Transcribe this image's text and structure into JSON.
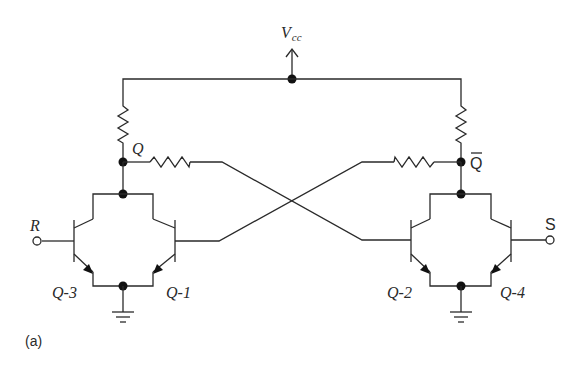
{
  "diagram": {
    "type": "circuit-schematic",
    "figure_label": "(a)",
    "supply": {
      "label_main": "V",
      "label_sub": "cc"
    },
    "outputs": {
      "q": "Q",
      "q_bar": "Q"
    },
    "inputs": {
      "reset": "R",
      "set": "S"
    },
    "transistors": [
      {
        "id": "q3",
        "label": "Q-3"
      },
      {
        "id": "q1",
        "label": "Q-1"
      },
      {
        "id": "q2",
        "label": "Q-2"
      },
      {
        "id": "q4",
        "label": "Q-4"
      }
    ],
    "colors": {
      "line": "#2a2a2a",
      "node": "#111111",
      "background": "#ffffff"
    }
  }
}
